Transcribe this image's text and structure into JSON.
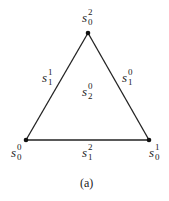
{
  "diagram": {
    "type": "simplex-triangle",
    "vertices": [
      {
        "id": "top",
        "label": {
          "base": "s",
          "sup": "2",
          "sub": "0"
        }
      },
      {
        "id": "bottom-left",
        "label": {
          "base": "s",
          "sup": "0",
          "sub": "0"
        }
      },
      {
        "id": "bottom-right",
        "label": {
          "base": "s",
          "sup": "1",
          "sub": "0"
        }
      }
    ],
    "edges": [
      {
        "id": "left",
        "label": {
          "base": "s",
          "sup": "1",
          "sub": "1"
        }
      },
      {
        "id": "right",
        "label": {
          "base": "s",
          "sup": "0",
          "sub": "1"
        }
      },
      {
        "id": "bottom",
        "label": {
          "base": "s",
          "sup": "2",
          "sub": "1"
        }
      }
    ],
    "face": {
      "label": {
        "base": "s",
        "sup": "0",
        "sub": "2"
      }
    },
    "caption": "(a)"
  }
}
